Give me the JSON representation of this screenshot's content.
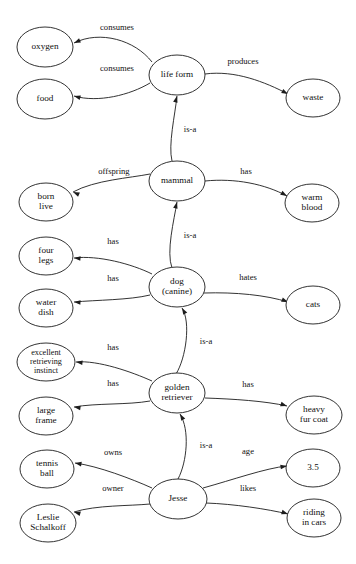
{
  "diagram": {
    "type": "semantic-network-graph",
    "background_color": "#ffffff",
    "line_color": "#1c1c1c",
    "text_color": "#101010",
    "nodes": [
      {
        "id": "oxygen",
        "label": "oxygen",
        "lines": [
          "oxygen"
        ],
        "cx": 45,
        "cy": 47,
        "rx": 28,
        "ry": 20
      },
      {
        "id": "food",
        "label": "food",
        "lines": [
          "food"
        ],
        "cx": 45,
        "cy": 99,
        "rx": 28,
        "ry": 20
      },
      {
        "id": "life_form",
        "label": "life form",
        "lines": [
          "life form"
        ],
        "cx": 177,
        "cy": 75,
        "rx": 28,
        "ry": 20
      },
      {
        "id": "waste",
        "label": "waste",
        "lines": [
          "waste"
        ],
        "cx": 313,
        "cy": 98,
        "rx": 27,
        "ry": 19
      },
      {
        "id": "mammal",
        "label": "mammal",
        "lines": [
          "mammal"
        ],
        "cx": 177,
        "cy": 181,
        "rx": 28,
        "ry": 20
      },
      {
        "id": "born_live",
        "label": "born live",
        "lines": [
          "born",
          "live"
        ],
        "cx": 46,
        "cy": 202,
        "rx": 27,
        "ry": 19
      },
      {
        "id": "warm_blood",
        "label": "warm blood",
        "lines": [
          "warm",
          "blood"
        ],
        "cx": 312,
        "cy": 203,
        "rx": 27,
        "ry": 19
      },
      {
        "id": "four_legs",
        "label": "four legs",
        "lines": [
          "four",
          "legs"
        ],
        "cx": 46,
        "cy": 256,
        "rx": 27,
        "ry": 19
      },
      {
        "id": "dog",
        "label": "dog (canine)",
        "lines": [
          "dog",
          "(canine)"
        ],
        "cx": 177,
        "cy": 287,
        "rx": 28,
        "ry": 20
      },
      {
        "id": "water_dish",
        "label": "water dish",
        "lines": [
          "water",
          "dish"
        ],
        "cx": 46,
        "cy": 308,
        "rx": 27,
        "ry": 19
      },
      {
        "id": "cats",
        "label": "cats",
        "lines": [
          "cats"
        ],
        "cx": 313,
        "cy": 305,
        "rx": 27,
        "ry": 19
      },
      {
        "id": "instinct",
        "label": "excellent retrieving instinct",
        "lines": [
          "excellent",
          "retrieving",
          "instinct"
        ],
        "cx": 46,
        "cy": 362,
        "rx": 29,
        "ry": 19
      },
      {
        "id": "golden",
        "label": "golden retriever",
        "lines": [
          "golden",
          "retriever"
        ],
        "cx": 177,
        "cy": 393,
        "rx": 28,
        "ry": 20
      },
      {
        "id": "large_frame",
        "label": "large frame",
        "lines": [
          "large",
          "frame"
        ],
        "cx": 46,
        "cy": 416,
        "rx": 27,
        "ry": 19
      },
      {
        "id": "fur_coat",
        "label": "heavy fur coat",
        "lines": [
          "heavy",
          "fur coat"
        ],
        "cx": 314,
        "cy": 415,
        "rx": 28,
        "ry": 19
      },
      {
        "id": "tennis_ball",
        "label": "tennis ball",
        "lines": [
          "tennis",
          "ball"
        ],
        "cx": 47,
        "cy": 469,
        "rx": 27,
        "ry": 19
      },
      {
        "id": "jesse",
        "label": "Jesse",
        "lines": [
          "Jesse"
        ],
        "cx": 178,
        "cy": 499,
        "rx": 29,
        "ry": 20
      },
      {
        "id": "age_value",
        "label": "3.5",
        "lines": [
          "3.5"
        ],
        "cx": 313,
        "cy": 468,
        "rx": 27,
        "ry": 19
      },
      {
        "id": "leslie",
        "label": "Leslie Schalkoff",
        "lines": [
          "Leslie",
          "Schalkoff"
        ],
        "cx": 48,
        "cy": 523,
        "rx": 28,
        "ry": 19
      },
      {
        "id": "riding",
        "label": "riding in cars",
        "lines": [
          "riding",
          "in cars"
        ],
        "cx": 314,
        "cy": 518,
        "rx": 27,
        "ry": 19
      }
    ],
    "edges": [
      {
        "id": "e1",
        "from": "life_form",
        "to": "oxygen",
        "label": "consumes",
        "label_x": 117,
        "label_y": 28,
        "path": "M 152 62 C 135 40 100 30 74 43",
        "arrow_x": 74,
        "arrow_y": 43,
        "arrow_angle": 157
      },
      {
        "id": "e2",
        "from": "life_form",
        "to": "food",
        "label": "consumes",
        "label_x": 117,
        "label_y": 69,
        "path": "M 150 83 C 130 95 98 103 74 96",
        "arrow_x": 74,
        "arrow_y": 96,
        "arrow_angle": 196
      },
      {
        "id": "e3",
        "from": "life_form",
        "to": "waste",
        "label": "produces",
        "label_x": 243,
        "label_y": 62,
        "path": "M 205 74 C 235 70 265 82 288 94",
        "arrow_x": 288,
        "arrow_y": 94,
        "arrow_angle": 28
      },
      {
        "id": "e4",
        "from": "mammal",
        "to": "life_form",
        "label": "is-a",
        "label_x": 190,
        "label_y": 130,
        "path": "M 172 161 C 168 145 175 115 177 96",
        "arrow_x": 177,
        "arrow_y": 96,
        "arrow_angle": 285
      },
      {
        "id": "e5",
        "from": "mammal",
        "to": "born_live",
        "label": "offspring",
        "label_x": 114,
        "label_y": 172,
        "path": "M 150 174 C 130 178 95 180 73 192",
        "arrow_x": 73,
        "arrow_y": 192,
        "arrow_angle": 203
      },
      {
        "id": "e6",
        "from": "mammal",
        "to": "warm_blood",
        "label": "has",
        "label_x": 246,
        "label_y": 172,
        "path": "M 205 181 C 235 178 265 184 287 196",
        "arrow_x": 287,
        "arrow_y": 196,
        "arrow_angle": 30
      },
      {
        "id": "e7",
        "from": "dog",
        "to": "mammal",
        "label": "is-a",
        "label_x": 190,
        "label_y": 236,
        "path": "M 172 268 C 166 252 174 220 177 202",
        "arrow_x": 177,
        "arrow_y": 202,
        "arrow_angle": 285
      },
      {
        "id": "e8",
        "from": "dog",
        "to": "four_legs",
        "label": "has",
        "label_x": 113,
        "label_y": 242,
        "path": "M 152 274 C 132 264 98 255 74 258",
        "arrow_x": 74,
        "arrow_y": 258,
        "arrow_angle": 185
      },
      {
        "id": "e9",
        "from": "dog",
        "to": "water_dish",
        "label": "has",
        "label_x": 113,
        "label_y": 279,
        "path": "M 150 295 C 130 300 96 300 74 302",
        "arrow_x": 74,
        "arrow_y": 302,
        "arrow_angle": 184
      },
      {
        "id": "e10",
        "from": "dog",
        "to": "cats",
        "label": "hates",
        "label_x": 248,
        "label_y": 278,
        "path": "M 204 293 C 235 292 266 295 288 302",
        "arrow_x": 288,
        "arrow_y": 302,
        "arrow_angle": 22
      },
      {
        "id": "e11",
        "from": "golden",
        "to": "dog",
        "label": "is-a",
        "label_x": 206,
        "label_y": 342,
        "path": "M 176 374 C 186 358 191 322 182 308",
        "arrow_x": 182,
        "arrow_y": 308,
        "arrow_angle": 240
      },
      {
        "id": "e12",
        "from": "golden",
        "to": "instinct",
        "label": "has",
        "label_x": 113,
        "label_y": 348,
        "path": "M 152 381 C 132 372 98 360 76 362",
        "arrow_x": 76,
        "arrow_y": 362,
        "arrow_angle": 186
      },
      {
        "id": "e13",
        "from": "golden",
        "to": "large_frame",
        "label": "has",
        "label_x": 113,
        "label_y": 384,
        "path": "M 150 401 C 128 405 96 403 74 407",
        "arrow_x": 74,
        "arrow_y": 407,
        "arrow_angle": 188
      },
      {
        "id": "e14",
        "from": "golden",
        "to": "fur_coat",
        "label": "has",
        "label_x": 248,
        "label_y": 385,
        "path": "M 205 398 C 234 399 265 401 287 406",
        "arrow_x": 287,
        "arrow_y": 406,
        "arrow_angle": 18
      },
      {
        "id": "e15",
        "from": "jesse",
        "to": "golden",
        "label": "is-a",
        "label_x": 206,
        "label_y": 446,
        "path": "M 178 479 C 187 462 190 430 180 414",
        "arrow_x": 180,
        "arrow_y": 414,
        "arrow_angle": 240
      },
      {
        "id": "e16",
        "from": "jesse",
        "to": "tennis_ball",
        "label": "owns",
        "label_x": 113,
        "label_y": 453,
        "path": "M 152 488 C 132 479 98 466 75 463",
        "arrow_x": 75,
        "arrow_y": 463,
        "arrow_angle": 190
      },
      {
        "id": "e17",
        "from": "jesse",
        "to": "age_value",
        "label": "age",
        "label_x": 248,
        "label_y": 452,
        "path": "M 203 488 C 232 480 266 468 287 466",
        "arrow_x": 287,
        "arrow_y": 466,
        "arrow_angle": 352
      },
      {
        "id": "e18",
        "from": "jesse",
        "to": "leslie",
        "label": "owner",
        "label_x": 113,
        "label_y": 489,
        "path": "M 150 504 C 130 506 96 505 74 512",
        "arrow_x": 74,
        "arrow_y": 512,
        "arrow_angle": 196
      },
      {
        "id": "e19",
        "from": "jesse",
        "to": "riding",
        "label": "likes",
        "label_x": 248,
        "label_y": 489,
        "path": "M 206 503 C 234 504 267 509 288 514",
        "arrow_x": 288,
        "arrow_y": 514,
        "arrow_angle": 18
      }
    ]
  }
}
